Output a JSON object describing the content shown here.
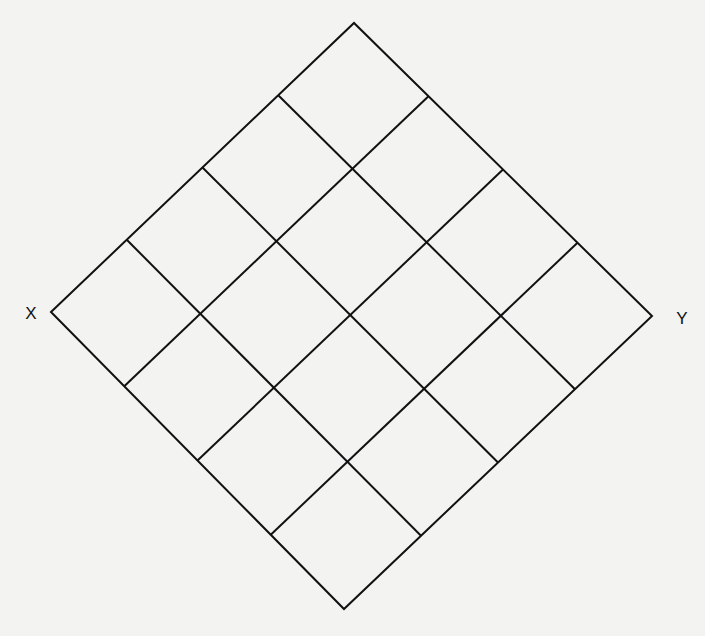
{
  "diagram": {
    "type": "rotated-square-grid",
    "grid_divisions": 4,
    "vertices": {
      "left": [
        51,
        312
      ],
      "top": [
        354,
        23
      ],
      "right": [
        652,
        316
      ],
      "bottom": [
        344,
        609
      ]
    },
    "stroke_color": "#111111",
    "stroke_width": 2,
    "background_color": "#f3f3f1",
    "labels": {
      "left": {
        "text": "X",
        "position": [
          31,
          313
        ]
      },
      "right": {
        "text": "Y",
        "position": [
          682,
          318
        ]
      }
    }
  }
}
